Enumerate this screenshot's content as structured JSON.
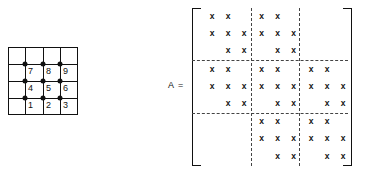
{
  "mesh": {
    "name": "node-grid",
    "rows": 4,
    "cols": 4,
    "node_labels": [
      "1",
      "2",
      "3",
      "4",
      "5",
      "6",
      "7",
      "8",
      "9"
    ],
    "node_count": 9,
    "line_color": "#111111",
    "dot_color": "#111111"
  },
  "equation": {
    "label": "A  ="
  },
  "matrix": {
    "name": "sparsity-matrix",
    "symbol": "A",
    "size": 9,
    "block_size": 3,
    "block_rows": 3,
    "block_cols": 3,
    "entry_glyph": "x",
    "separator_style": "dashed",
    "bracket_color": "#111111",
    "pattern": [
      [
        "x",
        "x",
        "",
        "x",
        "x",
        "",
        "",
        "",
        ""
      ],
      [
        "x",
        "x",
        "x",
        "x",
        "x",
        "x",
        "",
        "",
        ""
      ],
      [
        "",
        "x",
        "x",
        "",
        "x",
        "x",
        "",
        "",
        ""
      ],
      [
        "x",
        "x",
        "",
        "x",
        "x",
        "",
        "x",
        "x",
        ""
      ],
      [
        "x",
        "x",
        "x",
        "x",
        "x",
        "x",
        "x",
        "x",
        "x"
      ],
      [
        "",
        "x",
        "x",
        "",
        "x",
        "x",
        "",
        "x",
        "x"
      ],
      [
        "",
        "",
        "",
        "x",
        "x",
        "",
        "x",
        "x",
        ""
      ],
      [
        "",
        "",
        "",
        "x",
        "x",
        "x",
        "x",
        "x",
        "x"
      ],
      [
        "",
        "",
        "",
        "",
        "x",
        "x",
        "",
        "x",
        "x"
      ]
    ]
  }
}
